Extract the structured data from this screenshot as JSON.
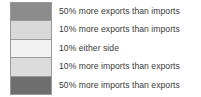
{
  "legend": {
    "title": "",
    "orientation": "vertical",
    "background_color": "#ffffff",
    "text_color": "#3a3a3a",
    "border_color": "#9a9a9a",
    "items": [
      {
        "label": "50% more exports than imports",
        "color": "#8c8c8c",
        "swatch_name": "swatch-50-more-exports"
      },
      {
        "label": "10% more exports than imports",
        "color": "#d9d9d9",
        "swatch_name": "swatch-10-more-exports"
      },
      {
        "label": "10% either side",
        "color": "#f2f2f2",
        "swatch_name": "swatch-10-either-side"
      },
      {
        "label": "10% more imports than exports",
        "color": "#dcdcdc",
        "swatch_name": "swatch-10-more-imports"
      },
      {
        "label": "50% more imports than exports",
        "color": "#6e6e6e",
        "swatch_name": "swatch-50-more-imports"
      }
    ]
  },
  "chart_data": {
    "type": "table",
    "title": "",
    "xlabel": "",
    "ylabel": "",
    "categories": [
      "50% more exports than imports",
      "10% more exports than imports",
      "10% either side",
      "10% more imports than exports",
      "50% more imports than exports"
    ],
    "values": [
      "#8c8c8c",
      "#d9d9d9",
      "#f2f2f2",
      "#dcdcdc",
      "#6e6e6e"
    ],
    "legend_position": "standalone",
    "grid": false
  }
}
